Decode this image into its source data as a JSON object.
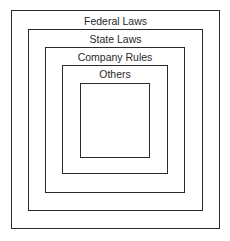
{
  "diagram": {
    "type": "nested-boxes",
    "layers": [
      {
        "id": "federal",
        "label": "Federal Laws"
      },
      {
        "id": "state",
        "label": "State Laws"
      },
      {
        "id": "company",
        "label": "Company Rules"
      },
      {
        "id": "others",
        "label": "Others"
      },
      {
        "id": "inner",
        "label": ""
      }
    ],
    "colors": {
      "line": "#2a2a2a",
      "background": "#ffffff",
      "text": "#2a2a2a"
    }
  }
}
